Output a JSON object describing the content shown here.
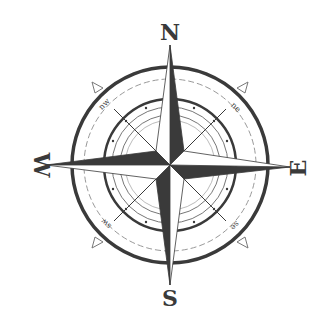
{
  "image": {
    "subject": "Compass rose",
    "colors": {
      "background": "#ffffff",
      "ink": "#3a3a3a",
      "light_fill": "#ffffff",
      "ring_line": "#555555",
      "dashed_line": "#888888"
    }
  },
  "labels": {
    "cardinal": {
      "north": "N",
      "east": "E",
      "south": "S",
      "west": "W"
    },
    "ordinal": {
      "northwest": "nw",
      "northeast": "ne",
      "southwest": "sw",
      "southeast": "se"
    }
  }
}
